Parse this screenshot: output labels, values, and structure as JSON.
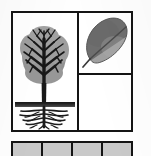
{
  "figure": {
    "background_color": "#ffffff",
    "border_color": "#141414",
    "panel": {
      "name": "bordered-figure-panel",
      "cells": [
        {
          "id": "tree-cell",
          "label": "Whole tree with root system",
          "position": "left",
          "contents": [
            "crown",
            "branches",
            "trunk",
            "soil-line",
            "roots"
          ]
        },
        {
          "id": "leaf-cell",
          "label": "Single leaf with midrib",
          "position": "top-right",
          "contents": [
            "leaf-blade",
            "midrib",
            "petiole"
          ]
        },
        {
          "id": "empty-cell",
          "label": "Empty panel",
          "position": "bottom-right",
          "contents": []
        }
      ]
    },
    "tree": {
      "crown_color": "#9a9a9a",
      "branch_color": "#181818",
      "trunk_color": "#181818",
      "soil_color": "#2b2b2b",
      "root_color": "#1c1c1c"
    },
    "leaf": {
      "upper_half_color": "#6e6e6e",
      "lower_half_color": "#a0a0a0",
      "midrib_color": "#4a4a4a",
      "petiole_color": "#3a3a3a",
      "outline_color": "#5a5a5a"
    },
    "bottom_strip": {
      "label": "Cropped row of swatch cells",
      "cell_fill": "#c9c9c9",
      "cell_count": 4,
      "cells": [
        {
          "id": "swatch-1",
          "label": ""
        },
        {
          "id": "swatch-2",
          "label": ""
        },
        {
          "id": "swatch-3",
          "label": ""
        },
        {
          "id": "swatch-4",
          "label": ""
        }
      ]
    }
  }
}
